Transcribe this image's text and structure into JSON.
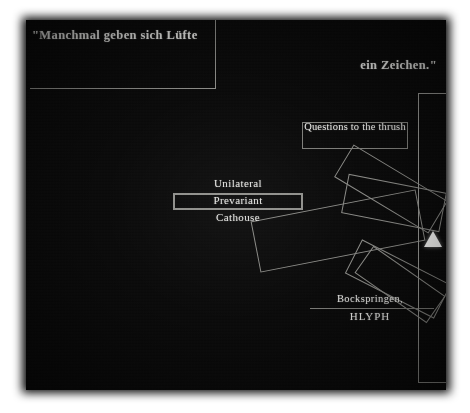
{
  "canvas": {
    "width": 470,
    "height": 413,
    "background_color": "#ffffff",
    "panel_color": "#090909",
    "ink_color": "#e9e9e6",
    "line_color": "#8a8a86",
    "marker_color": "#fdfdfb"
  },
  "quote": {
    "line1": "\"Manchmal geben sich Lüfte",
    "line2": "ein Zeichen.\""
  },
  "labels": {
    "thrush": "Questions to the thrush",
    "unilateral": "Unilateral",
    "prevariant": "Prevariant",
    "cathouse": "Cathouse",
    "bockspringen": "Bockspringen,",
    "hlyph": "HLYPH"
  },
  "marker": {
    "icon": "triangle-up-icon"
  },
  "shapes": {
    "rectangles": [
      {
        "name": "rotated-rect-upper-right",
        "rotation_deg": 31
      },
      {
        "name": "rotated-rect-upper-inner",
        "rotation_deg": 11
      },
      {
        "name": "rotated-rect-center-large",
        "rotation_deg": -11
      },
      {
        "name": "rotated-rect-lower-outer",
        "rotation_deg": 27
      },
      {
        "name": "rotated-rect-lower-inner",
        "rotation_deg": 35
      }
    ]
  }
}
